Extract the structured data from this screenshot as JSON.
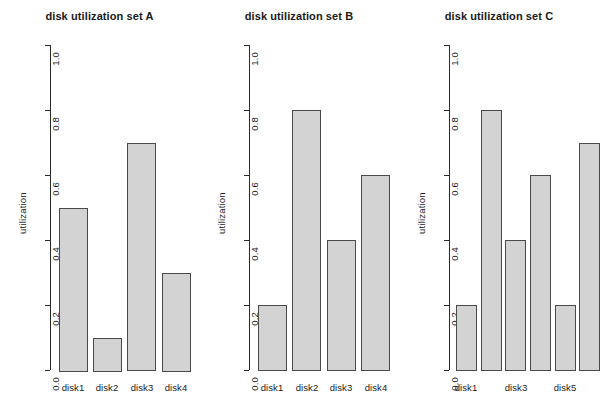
{
  "figure": {
    "background_color": "#ffffff",
    "bar_fill_color": "#d3d3d3",
    "bar_border_color": "#4a4a4a",
    "axis_color": "#2b2b2b",
    "text_color": "#1a1a1a"
  },
  "chart_data": [
    {
      "type": "bar",
      "title": "disk utilization set A",
      "xlabel": "",
      "ylabel": "utilization",
      "categories": [
        "disk1",
        "disk2",
        "disk3",
        "disk4"
      ],
      "values": [
        0.5,
        0.1,
        0.7,
        0.3
      ],
      "ylim": [
        0.0,
        1.0
      ],
      "ytick_labels": [
        "0.0",
        "0.2",
        "0.4",
        "0.6",
        "0.8",
        "1.0"
      ],
      "ytick_values": [
        0.0,
        0.2,
        0.4,
        0.6,
        0.8,
        1.0
      ],
      "xtick_labels_shown": [
        "disk1",
        "disk2",
        "disk3",
        "disk4"
      ],
      "grid": false,
      "legend": false
    },
    {
      "type": "bar",
      "title": "disk utilization set B",
      "xlabel": "",
      "ylabel": "utilization",
      "categories": [
        "disk1",
        "disk2",
        "disk3",
        "disk4"
      ],
      "values": [
        0.2,
        0.8,
        0.4,
        0.6
      ],
      "ylim": [
        0.0,
        1.0
      ],
      "ytick_labels": [
        "0.0",
        "0.2",
        "0.4",
        "0.6",
        "0.8",
        "1.0"
      ],
      "ytick_values": [
        0.0,
        0.2,
        0.4,
        0.6,
        0.8,
        1.0
      ],
      "xtick_labels_shown": [
        "disk1",
        "disk2",
        "disk3",
        "disk4"
      ],
      "grid": false,
      "legend": false
    },
    {
      "type": "bar",
      "title": "disk utilization set C",
      "xlabel": "",
      "ylabel": "utilization",
      "categories": [
        "disk1",
        "disk2",
        "disk3",
        "disk4",
        "disk5",
        "disk6"
      ],
      "values": [
        0.2,
        0.8,
        0.4,
        0.6,
        0.2,
        0.7
      ],
      "ylim": [
        0.0,
        1.0
      ],
      "ytick_labels": [
        "0.0",
        "0.2",
        "0.4",
        "0.6",
        "0.8",
        "1.0"
      ],
      "ytick_values": [
        0.0,
        0.2,
        0.4,
        0.6,
        0.8,
        1.0
      ],
      "xtick_labels_shown": [
        "disk1",
        "",
        "disk3",
        "",
        "disk5",
        ""
      ],
      "grid": false,
      "legend": false
    }
  ]
}
